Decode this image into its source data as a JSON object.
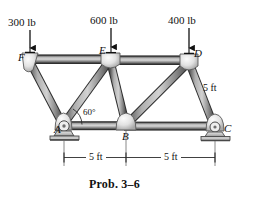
{
  "figure": {
    "caption": "Prob. 3–6",
    "background_color": "#ffffff",
    "member_color": "#8c8c8c",
    "member_edge_color": "#3a3a3a",
    "gusset_color": "#e0e0e0",
    "line_color": "#1a1a1a"
  },
  "loads": [
    {
      "id": "load-F",
      "label": "300 lb",
      "applied_at": "F",
      "direction": "down"
    },
    {
      "id": "load-E",
      "label": "600 lb",
      "applied_at": "E",
      "direction": "down"
    },
    {
      "id": "load-D",
      "label": "400 lb",
      "applied_at": "D",
      "direction": "down"
    }
  ],
  "joints": [
    {
      "id": "A",
      "label": "A",
      "support": "pin"
    },
    {
      "id": "B",
      "label": "B",
      "support": "none"
    },
    {
      "id": "C",
      "label": "C",
      "support": "roller"
    },
    {
      "id": "D",
      "label": "D",
      "support": "none"
    },
    {
      "id": "E",
      "label": "E",
      "support": "none"
    },
    {
      "id": "F",
      "label": "F",
      "support": "none"
    }
  ],
  "annotations": {
    "angle": "60°",
    "member_length": "5 ft"
  },
  "dimensions": [
    {
      "id": "dim-left",
      "label": "5 ft",
      "from": "A",
      "to": "B"
    },
    {
      "id": "dim-right",
      "label": "5 ft",
      "from": "B",
      "to": "C"
    }
  ]
}
